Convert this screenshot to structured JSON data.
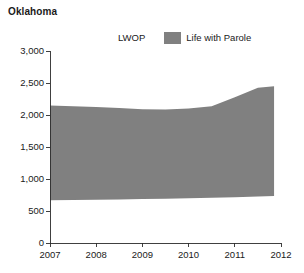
{
  "chart_data": {
    "type": "area",
    "title": "Oklahoma",
    "subtitle": "",
    "xlabel": "",
    "ylabel": "",
    "stacked": true,
    "grid": false,
    "legend_position": "top-center",
    "xlim": [
      2007,
      2012
    ],
    "ylim": [
      0,
      3000
    ],
    "y_ticks": [
      0,
      500,
      1000,
      1500,
      2000,
      2500,
      3000
    ],
    "y_tick_labels": [
      "0",
      "500",
      "1,000",
      "1,500",
      "2,000",
      "2,500",
      "3,000"
    ],
    "x_ticks": [
      2007,
      2008,
      2009,
      2010,
      2011,
      2012
    ],
    "x_tick_labels": [
      "2007",
      "2008",
      "2009",
      "2010",
      "2011",
      "2012"
    ],
    "x": [
      2007,
      2007.5,
      2008,
      2008.5,
      2009,
      2009.5,
      2010,
      2010.5,
      2011,
      2011.5,
      2011.85
    ],
    "series": [
      {
        "name": "LWOP",
        "color": "#ffffff",
        "values": [
          668,
          670,
          675,
          680,
          686,
          692,
          700,
          708,
          716,
          727,
          735
        ]
      },
      {
        "name": "Life with Parole",
        "color": "#808080",
        "values": [
          1480,
          1465,
          1450,
          1430,
          1405,
          1395,
          1400,
          1430,
          1560,
          1700,
          1715
        ]
      }
    ],
    "totals": [
      2148,
      2135,
      2125,
      2110,
      2091,
      2087,
      2100,
      2138,
      2276,
      2427,
      2450
    ],
    "annotations": []
  },
  "legend": {
    "entries": [
      {
        "label": "LWOP",
        "swatch": "white-swatch"
      },
      {
        "label": "Life with Parole",
        "swatch": "gray-swatch"
      }
    ]
  }
}
